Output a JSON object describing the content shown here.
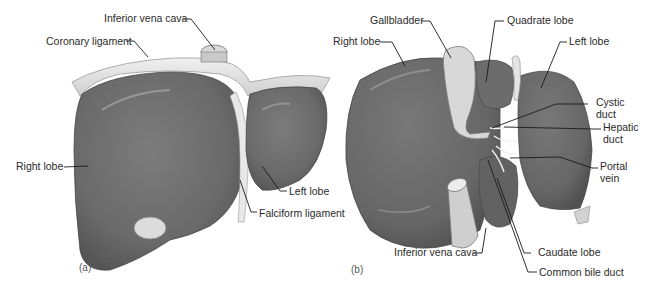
{
  "figure": {
    "panel_a": {
      "id_label": "(a)",
      "signature": "Loechel",
      "labels": {
        "inferior_vena_cava": "Inferior vena cava",
        "coronary_ligament": "Coronary ligament",
        "right_lobe": "Right lobe",
        "left_lobe": "Left lobe",
        "falciform_ligament": "Falciform ligament"
      }
    },
    "panel_b": {
      "id_label": "(b)",
      "labels": {
        "gallbladder": "Gallbladder",
        "quadrate_lobe": "Quadrate lobe",
        "right_lobe": "Right lobe",
        "left_lobe": "Left lobe",
        "cystic_duct": "Cystic duct",
        "hepatic_duct": "Hepatic duct",
        "portal_vein": "Portal vein",
        "inferior_vena_cava": "Inferior vena cava",
        "caudate_lobe": "Caudate lobe",
        "common_bile_duct": "Common bile duct"
      }
    },
    "colors": {
      "liver": "#6e6e6e",
      "liver_dark": "#5a5a5a",
      "ligament": "#e4e4e4",
      "gallbladder": "#d6d6d6",
      "leader_line": "#1a1a1a",
      "text": "#2a2a2a"
    }
  }
}
